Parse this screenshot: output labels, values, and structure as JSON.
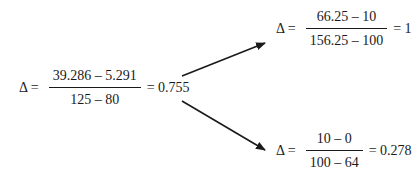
{
  "equations": {
    "main": {
      "lhs": "Δ =",
      "numerator": "39.286 – 5.291",
      "denominator": "125 – 80",
      "result": "= 0.755"
    },
    "upper": {
      "lhs": "Δ =",
      "numerator": "66.25 – 10",
      "denominator": "156.25 – 100",
      "result": "= 1"
    },
    "lower": {
      "lhs": "Δ =",
      "numerator": "10 – 0",
      "denominator": "100 – 64",
      "result": "= 0.278"
    }
  },
  "arrows": [
    {
      "from": "main",
      "to": "upper"
    },
    {
      "from": "main",
      "to": "lower"
    }
  ]
}
